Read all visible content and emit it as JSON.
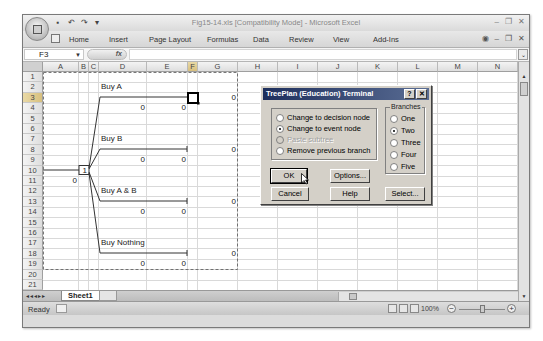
{
  "window": {
    "title": "Fig15-14.xls  [Compatibility Mode] - Microsoft Excel",
    "controls": [
      "–",
      "❐",
      "✕"
    ]
  },
  "quick_access": {
    "items": [
      "save-icon",
      "undo-icon",
      "redo-icon",
      "customize-icon"
    ]
  },
  "ribbon": {
    "tabs": [
      "Home",
      "Insert",
      "Page Layout",
      "Formulas",
      "Data",
      "Review",
      "View",
      "Add-Ins"
    ],
    "right_controls": [
      "help-icon",
      "–",
      "❐",
      "✕"
    ]
  },
  "formula_bar": {
    "name_box": "F3",
    "fx_label": "fx",
    "formula": ""
  },
  "grid": {
    "columns": [
      "A",
      "B",
      "C",
      "D",
      "E",
      "F",
      "G",
      "H",
      "I",
      "J",
      "K",
      "L",
      "M",
      "N"
    ],
    "rows": [
      "1",
      "2",
      "3",
      "4",
      "5",
      "6",
      "7",
      "8",
      "9",
      "10",
      "11",
      "12",
      "13",
      "14",
      "15",
      "16",
      "17",
      "18",
      "19",
      "20",
      "21"
    ],
    "selected_cell": "F3",
    "selected_column": "F",
    "selected_row": "3"
  },
  "tree": {
    "decision_node_label": "1",
    "root_value": "0",
    "branches": [
      {
        "label": "Buy A",
        "d_value": "0",
        "e_value": "0",
        "g_value": "0"
      },
      {
        "label": "Buy B",
        "d_value": "0",
        "e_value": "0",
        "g_value": "0"
      },
      {
        "label": "Buy A & B",
        "d_value": "0",
        "e_value": "0",
        "g_value": "0"
      },
      {
        "label": "Buy Nothing",
        "d_value": "0",
        "e_value": "0",
        "g_value": "0"
      }
    ]
  },
  "sheets": {
    "tabs": [
      "Sheet1"
    ],
    "active": "Sheet1"
  },
  "status_bar": {
    "status": "Ready",
    "zoom": "100%"
  },
  "dialog": {
    "title": "TreePlan (Education) Terminal",
    "help_btn": "?",
    "close_btn": "✕",
    "options": [
      {
        "label": "Change to decision node",
        "selected": false,
        "disabled": false
      },
      {
        "label": "Change to event node",
        "selected": true,
        "disabled": false
      },
      {
        "label": "Paste subtree",
        "selected": false,
        "disabled": true
      },
      {
        "label": "Remove previous branch",
        "selected": false,
        "disabled": false
      }
    ],
    "branches_group": {
      "label": "Branches",
      "options": [
        {
          "label": "One",
          "selected": false
        },
        {
          "label": "Two",
          "selected": true
        },
        {
          "label": "Three",
          "selected": false
        },
        {
          "label": "Four",
          "selected": false
        },
        {
          "label": "Five",
          "selected": false
        }
      ]
    },
    "buttons": {
      "ok": "OK",
      "options": "Options...",
      "cancel": "Cancel",
      "help": "Help",
      "select": "Select..."
    }
  }
}
